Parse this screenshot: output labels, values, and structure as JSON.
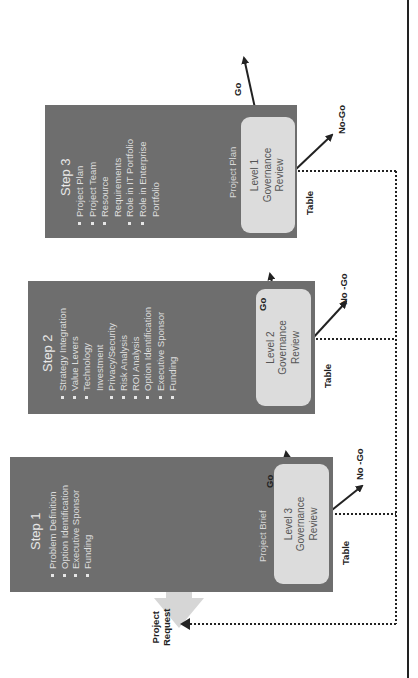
{
  "diagram": {
    "orientation": "rotated-90-ccw",
    "colors": {
      "step_box": "#6e6e6e",
      "review_box": "#dcdcdc",
      "arrow_fill": "#d6d6d6",
      "line": "#222222"
    },
    "entry": {
      "label_line1": "Project",
      "label_line2": "Request"
    },
    "steps": [
      {
        "title": "Step 1",
        "items": [
          "Problem Definition",
          "Option Identification",
          "Executive Sponsor",
          "Funding"
        ],
        "document": "Project Brief",
        "review": {
          "line1": "Level 3",
          "line2": "Governance",
          "line3": "Review"
        },
        "go_label": "Go",
        "nogo_label": "No -Go",
        "table_label": "Table"
      },
      {
        "title": "Step 2",
        "items": [
          "Strategy Integration",
          "Value Levers",
          "Technology",
          "Investment",
          "Privacy/Security",
          "Risk Analysis",
          "ROI Analysis",
          "Option Identification",
          "Executive Sponsor",
          "Funding"
        ],
        "document": "",
        "review": {
          "line1": "Level 2",
          "line2": "Governance",
          "line3": "Review"
        },
        "go_label": "Go",
        "nogo_label": "No -Go",
        "table_label": "Table"
      },
      {
        "title": "Step 3",
        "items": [
          "Project Plan",
          "Project Team",
          "Resource",
          "Requirements",
          "Role in IT Portfolio",
          "Role in Enterprise",
          "Portfolio"
        ],
        "document": "Project Plan",
        "review": {
          "line1": "Level 1",
          "line2": "Governance",
          "line3": "Review"
        },
        "go_label": "Go",
        "nogo_label": "No-Go",
        "table_label": "Table"
      }
    ]
  }
}
